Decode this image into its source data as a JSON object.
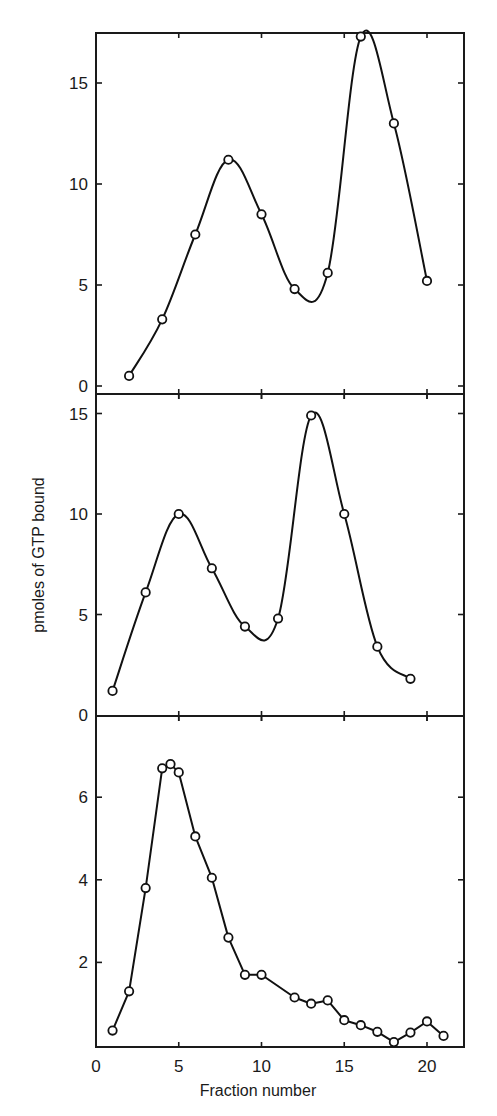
{
  "chart_data": [
    {
      "type": "line",
      "panel": "top",
      "title": "",
      "xlabel": "Fraction number",
      "ylabel": "pmoles of GTP bound",
      "xlim": [
        0,
        22
      ],
      "ylim": [
        0,
        17.5
      ],
      "yticks": [
        0,
        5,
        10,
        15
      ],
      "xticks": [
        0,
        5,
        10,
        15,
        20
      ],
      "grid": false,
      "smooth": true,
      "series": [
        {
          "name": "top",
          "x": [
            2,
            4,
            6,
            8,
            10,
            12,
            14,
            16,
            18,
            20
          ],
          "values": [
            0.5,
            3.3,
            7.5,
            11.2,
            8.5,
            4.8,
            5.6,
            17.3,
            13.0,
            5.2
          ]
        }
      ]
    },
    {
      "type": "line",
      "panel": "middle",
      "title": "",
      "xlabel": "Fraction number",
      "ylabel": "pmoles of GTP bound",
      "xlim": [
        0,
        22
      ],
      "ylim": [
        0,
        16
      ],
      "yticks": [
        0,
        5,
        10,
        15
      ],
      "xticks": [
        0,
        5,
        10,
        15,
        20
      ],
      "grid": false,
      "smooth": true,
      "series": [
        {
          "name": "middle",
          "x": [
            1,
            3,
            5,
            7,
            9,
            11,
            13,
            15,
            17,
            19
          ],
          "values": [
            1.2,
            6.1,
            10.0,
            7.3,
            4.4,
            4.8,
            14.9,
            10.0,
            3.4,
            1.8
          ]
        }
      ]
    },
    {
      "type": "line",
      "panel": "bottom",
      "title": "",
      "xlabel": "Fraction number",
      "ylabel": "pmoles of GTP bound",
      "xlim": [
        0,
        22
      ],
      "ylim": [
        0,
        7.8
      ],
      "yticks": [
        2,
        4,
        6
      ],
      "xticks": [
        0,
        5,
        10,
        15,
        20
      ],
      "grid": false,
      "smooth": false,
      "series": [
        {
          "name": "bottom",
          "x": [
            1,
            2,
            3,
            4,
            4.5,
            5,
            6,
            7,
            8,
            9,
            10,
            12,
            13,
            14,
            15,
            16,
            17,
            18,
            19,
            20,
            21
          ],
          "values": [
            0.35,
            1.3,
            3.8,
            6.7,
            6.8,
            6.6,
            5.05,
            4.05,
            2.6,
            1.7,
            1.7,
            1.15,
            1.0,
            1.08,
            0.6,
            0.48,
            0.32,
            0.07,
            0.3,
            0.57,
            0.22
          ]
        }
      ]
    }
  ],
  "axes": {
    "xlabel": "Fraction number",
    "ylabel": "pmoles of GTP bound",
    "x_tick_labels": [
      "0",
      "5",
      "10",
      "15",
      "20"
    ],
    "top_y_tick_labels": [
      "0",
      "5",
      "10",
      "15"
    ],
    "middle_y_tick_labels": [
      "0",
      "5",
      "10",
      "15"
    ],
    "bottom_y_tick_labels": [
      "2",
      "4",
      "6"
    ]
  }
}
